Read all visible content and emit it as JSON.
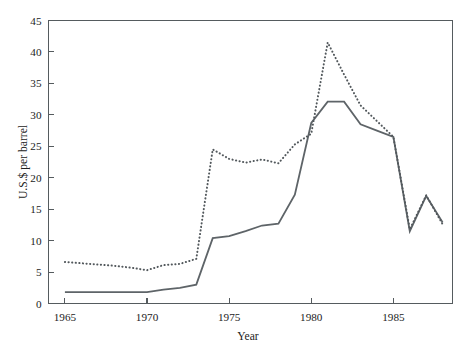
{
  "chart_data": {
    "type": "line",
    "title": "",
    "xlabel": "Year",
    "ylabel": "U.S.$ per barrel",
    "xlim": [
      1964,
      1988.6
    ],
    "ylim": [
      0,
      45
    ],
    "grid": false,
    "legend": "none",
    "x_ticks": [
      1965,
      1970,
      1975,
      1980,
      1985
    ],
    "x_tick_labels": [
      "1965",
      "1970",
      "1975",
      "1980",
      "1985"
    ],
    "y_ticks": [
      0,
      5,
      10,
      15,
      20,
      25,
      30,
      35,
      40,
      45
    ],
    "y_tick_labels": [
      "0",
      "5",
      "10",
      "15",
      "20",
      "25",
      "30",
      "35",
      "40",
      "45"
    ],
    "x": [
      1965,
      1966,
      1967,
      1968,
      1969,
      1970,
      1971,
      1972,
      1973,
      1974,
      1975,
      1976,
      1977,
      1978,
      1979,
      1980,
      1981,
      1982,
      1983,
      1984,
      1985,
      1986,
      1987,
      1988
    ],
    "series": [
      {
        "name": "Nominal price",
        "style": "solid",
        "color": "#5e6468",
        "values": [
          1.8,
          1.8,
          1.8,
          1.8,
          1.8,
          1.8,
          2.2,
          2.5,
          3.0,
          10.4,
          10.7,
          11.5,
          12.4,
          12.7,
          17.3,
          28.7,
          32.1,
          32.1,
          28.5,
          27.5,
          26.5,
          11.5,
          17.1,
          12.9
        ]
      },
      {
        "name": "Real price (constant dollars)",
        "style": "dotted",
        "color": "#52585c",
        "values": [
          6.6,
          6.4,
          6.2,
          6.0,
          5.7,
          5.3,
          6.1,
          6.3,
          7.1,
          24.5,
          23.0,
          22.4,
          22.9,
          22.3,
          25.3,
          27.0,
          41.5,
          36.4,
          31.5,
          29.0,
          26.5,
          11.8,
          17.2,
          12.6
        ]
      }
    ],
    "annotations": []
  }
}
